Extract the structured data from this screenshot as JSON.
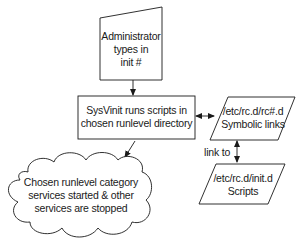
{
  "diagram": {
    "nodes": {
      "admin_input": {
        "shape": "manual-input",
        "lines": [
          "Administrator",
          "types in",
          "init #"
        ]
      },
      "sysvinit": {
        "shape": "process",
        "lines": [
          "SysVinit runs scripts in",
          "chosen runlevel directory"
        ]
      },
      "rc_links": {
        "shape": "parallelogram",
        "lines": [
          "/etc/rc.d/rc#.d",
          "Symbolic links"
        ]
      },
      "init_scripts": {
        "shape": "parallelogram",
        "lines": [
          "/etc/rc.d/init.d",
          "Scripts"
        ]
      },
      "services_result": {
        "shape": "cloud",
        "lines": [
          "Chosen runlevel category",
          "services started & other",
          "services are stopped"
        ]
      }
    },
    "edges": [
      {
        "from": "admin_input",
        "to": "sysvinit",
        "type": "arrow"
      },
      {
        "from": "sysvinit",
        "to": "rc_links",
        "type": "double-arrow"
      },
      {
        "from": "rc_links",
        "to": "init_scripts",
        "type": "double-arrow",
        "label": "link to"
      },
      {
        "from": "sysvinit",
        "to": "services_result",
        "type": "arrow"
      }
    ],
    "colors": {
      "stroke": "#1a1a1a",
      "fill": "#ffffff",
      "text": "#1a1a1a"
    }
  }
}
